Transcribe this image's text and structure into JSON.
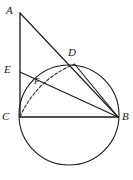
{
  "figure": {
    "background_color": "#ffffff",
    "stroke_color": "#1a1a1a",
    "dashed_color": "#2b2b2b",
    "width": 133,
    "height": 180,
    "labels": {
      "a": "A",
      "b": "B",
      "c": "C",
      "d": "D",
      "e": "E",
      "f": "F"
    },
    "points": {
      "A": {
        "x": 20,
        "y": 13
      },
      "B": {
        "x": 118,
        "y": 117
      },
      "C": {
        "x": 20,
        "y": 117
      },
      "D": {
        "x": 74.5,
        "y": 64
      },
      "E": {
        "x": 20,
        "y": 72
      },
      "F": {
        "x": 40,
        "y": 81
      }
    },
    "label_positions": {
      "A": {
        "x": 6,
        "y": 5
      },
      "B": {
        "x": 122,
        "y": 112
      },
      "C": {
        "x": 3,
        "y": 112
      },
      "D": {
        "x": 69,
        "y": 48
      },
      "E": {
        "x": 5,
        "y": 65
      },
      "F": {
        "x": 34,
        "y": 78
      }
    },
    "circle": {
      "cx": 69,
      "cy": 115,
      "r": 50,
      "stroke_width": 1.1
    },
    "segments": [
      {
        "name": "segment-AC",
        "from": "A",
        "to": "C",
        "style": "solid"
      },
      {
        "name": "segment-AB",
        "from": "A",
        "to": "B",
        "style": "solid"
      },
      {
        "name": "segment-CB",
        "from": "C",
        "to": "B",
        "style": "solid"
      },
      {
        "name": "segment-EB",
        "from": "E",
        "to": "B",
        "style": "solid"
      },
      {
        "name": "segment-DB",
        "from": "D",
        "to": "B",
        "style": "solid"
      }
    ],
    "dashed_arc": {
      "name": "arc-C-to-D",
      "from": "C",
      "to": "D",
      "center": "B",
      "radius": 98,
      "dash_pattern": "3 2"
    }
  }
}
